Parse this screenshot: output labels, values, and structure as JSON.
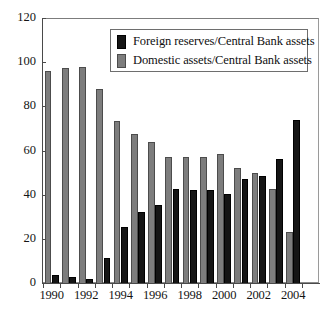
{
  "chart_data": {
    "type": "bar",
    "title": "",
    "xlabel": "",
    "ylabel": "",
    "ylim": [
      0,
      120
    ],
    "ytick_step": 20,
    "yticks": [
      0,
      20,
      40,
      60,
      80,
      100,
      120
    ],
    "grid": false,
    "legend_position": "top-center",
    "bar_order_in_group": [
      "Domestic assets/Central Bank assets",
      "Foreign reserves/Central Bank assets"
    ],
    "categories": [
      "1990",
      "1991",
      "1992",
      "1993",
      "1994",
      "1995",
      "1996",
      "1997",
      "1998",
      "1999",
      "2000",
      "2001",
      "2002",
      "2003",
      "2004",
      "2005"
    ],
    "xtick_labels_shown": [
      "1990",
      "1992",
      "1994",
      "1996",
      "1998",
      "2000",
      "2002",
      "2004"
    ],
    "series": [
      {
        "name": "Foreign reserves/Central Bank assets",
        "color": "#151515",
        "values": [
          3.5,
          2.5,
          2.0,
          11.5,
          25.5,
          32.0,
          35.5,
          42.5,
          42.0,
          42.0,
          40.5,
          47.0,
          48.5,
          56.0,
          74.0,
          0
        ]
      },
      {
        "name": "Domestic assets/Central Bank assets",
        "color": "#7d7d7d",
        "values": [
          96.0,
          97.5,
          98.0,
          88.0,
          73.5,
          67.5,
          64.0,
          57.0,
          57.0,
          57.0,
          58.5,
          52.0,
          50.0,
          42.5,
          23.0,
          0
        ]
      }
    ]
  },
  "legend": {
    "entries": [
      {
        "label": "Foreign reserves/Central Bank assets",
        "swatch": "black"
      },
      {
        "label": "Domestic assets/Central Bank assets",
        "swatch": "gray"
      }
    ]
  },
  "caption": {
    "text": ""
  }
}
